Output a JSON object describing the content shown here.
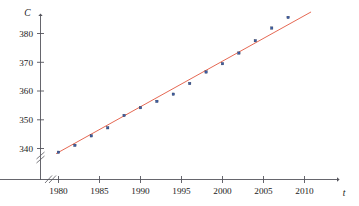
{
  "chart_data": {
    "type": "scatter",
    "title": "",
    "subtitle": "",
    "xlabel": "t",
    "ylabel": "C",
    "xlim": [
      1978,
      2011
    ],
    "ylim": [
      335.5,
      384
    ],
    "grid": false,
    "legend": null,
    "x_ticks": [
      1980,
      1985,
      1990,
      1995,
      2000,
      2005,
      2010
    ],
    "y_ticks": [
      340,
      350,
      360,
      370,
      380
    ],
    "axis_breaks": [
      "x-axis near origin",
      "y-axis near origin"
    ],
    "x": [
      1980,
      1982,
      1984,
      1986,
      1988,
      1990,
      1992,
      1994,
      1996,
      1998,
      2000,
      2002,
      2004,
      2006,
      2008
    ],
    "values": [
      338.7,
      341.1,
      344.4,
      347.2,
      351.5,
      354.2,
      356.4,
      358.9,
      362.6,
      366.6,
      369.5,
      373.2,
      377.5,
      381.9,
      385.6
    ],
    "series": [
      {
        "name": "data points",
        "marker": "square",
        "color": "#3b5ea8",
        "values": [
          338.7,
          341.1,
          344.4,
          347.2,
          351.5,
          354.2,
          356.4,
          358.9,
          362.6,
          366.6,
          369.5,
          373.2,
          377.5,
          381.9,
          385.6
        ]
      },
      {
        "name": "regression line",
        "type": "line",
        "color": "#e2573f",
        "endpoints": [
          [
            1979.7,
            338.2
          ],
          [
            2010.8,
            387.5
          ]
        ]
      }
    ]
  },
  "axes": {
    "y_label": "C",
    "x_label": "t",
    "x_tick_labels": [
      "1980",
      "1985",
      "1990",
      "1995",
      "2000",
      "2005",
      "2010"
    ],
    "y_tick_labels": [
      "340",
      "350",
      "360",
      "370",
      "380"
    ]
  },
  "colors": {
    "axis": "#55555c",
    "point": "#3b5ea8",
    "line": "#e2573f",
    "background": "#ffffff"
  }
}
